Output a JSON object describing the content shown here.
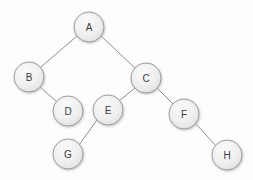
{
  "diagram": {
    "type": "tree",
    "background_color": "#fdfdfd",
    "node": {
      "radius": 15,
      "fill_top_color": "#f5f5f5",
      "fill_bottom_color": "#e3e3e3",
      "border_color": "#9b9b9b",
      "label_color": "#3a3a3a",
      "shadow_color": "#cccccc"
    },
    "edge": {
      "color": "#8d8d8d",
      "width": 1
    },
    "nodes": [
      {
        "id": "A",
        "label": "A",
        "cx": 89,
        "cy": 27,
        "r": 15
      },
      {
        "id": "B",
        "label": "B",
        "cx": 29,
        "cy": 77,
        "r": 15
      },
      {
        "id": "C",
        "label": "C",
        "cx": 146,
        "cy": 78,
        "r": 15
      },
      {
        "id": "D",
        "label": "D",
        "cx": 68,
        "cy": 111,
        "r": 15
      },
      {
        "id": "E",
        "label": "E",
        "cx": 108,
        "cy": 110,
        "r": 15
      },
      {
        "id": "F",
        "label": "F",
        "cx": 184,
        "cy": 114,
        "r": 15
      },
      {
        "id": "G",
        "label": "G",
        "cx": 68,
        "cy": 154,
        "r": 15
      },
      {
        "id": "H",
        "label": "H",
        "cx": 227,
        "cy": 155,
        "r": 15
      }
    ],
    "edges": [
      {
        "id": "A-B",
        "from": "A",
        "to": "B",
        "x1": 77,
        "y1": 36,
        "x2": 41,
        "y2": 67
      },
      {
        "id": "A-C",
        "from": "A",
        "to": "C",
        "x1": 101,
        "y1": 36,
        "x2": 135,
        "y2": 68
      },
      {
        "id": "B-D",
        "from": "B",
        "to": "D",
        "x1": 40,
        "y1": 87,
        "x2": 57,
        "y2": 102
      },
      {
        "id": "C-E",
        "from": "C",
        "to": "E",
        "x1": 135,
        "y1": 88,
        "x2": 119,
        "y2": 101
      },
      {
        "id": "C-F",
        "from": "C",
        "to": "F",
        "x1": 157,
        "y1": 88,
        "x2": 173,
        "y2": 104
      },
      {
        "id": "E-G",
        "from": "E",
        "to": "G",
        "x1": 97,
        "y1": 120,
        "x2": 79,
        "y2": 145
      },
      {
        "id": "F-H",
        "from": "F",
        "to": "H",
        "x1": 196,
        "y1": 124,
        "x2": 216,
        "y2": 146
      }
    ]
  }
}
